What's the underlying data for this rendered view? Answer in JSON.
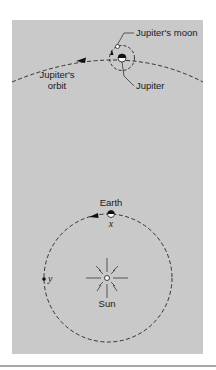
{
  "figure": {
    "background_color": "#c9c9c9",
    "line_color": "#222222",
    "labels": {
      "jupiters_moon": "Jupiter's moon",
      "jupiter": "Jupiter",
      "jupiters_orbit_line1": "Jupiter's",
      "jupiters_orbit_line2": "orbit",
      "earth": "Earth",
      "sun": "Sun",
      "point_x": "x",
      "point_y": "y"
    }
  }
}
